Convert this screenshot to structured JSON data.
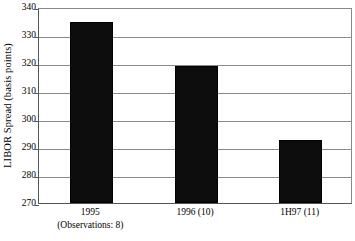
{
  "chart_data": {
    "type": "bar",
    "title": "",
    "subtitle": "",
    "xlabel": "",
    "ylabel": "LIBOR Spread (basis points)",
    "categories": [
      "1995",
      "1996 (10)",
      "1H97 (11)"
    ],
    "category_sublabels": [
      "(Observations: 8)",
      "",
      ""
    ],
    "values": [
      334.5,
      319,
      292.5
    ],
    "ylim": [
      270,
      340
    ],
    "yticks": [
      270,
      280,
      290,
      300,
      310,
      320,
      330,
      340
    ],
    "ytick_labels": [
      "270",
      "280",
      "290",
      "300",
      "310",
      "320",
      "330",
      "340"
    ],
    "grid": true,
    "legend": "none",
    "series": [
      {
        "name": "LIBOR Spread",
        "values": [
          334.5,
          319,
          292.5
        ]
      }
    ],
    "colors": {
      "bar_fill": "#0d0d0d",
      "bar_edge": "#000000",
      "gridline": "#8a8a8a",
      "axis": "#555555",
      "background": "#ffffff",
      "text": "#000000"
    }
  }
}
